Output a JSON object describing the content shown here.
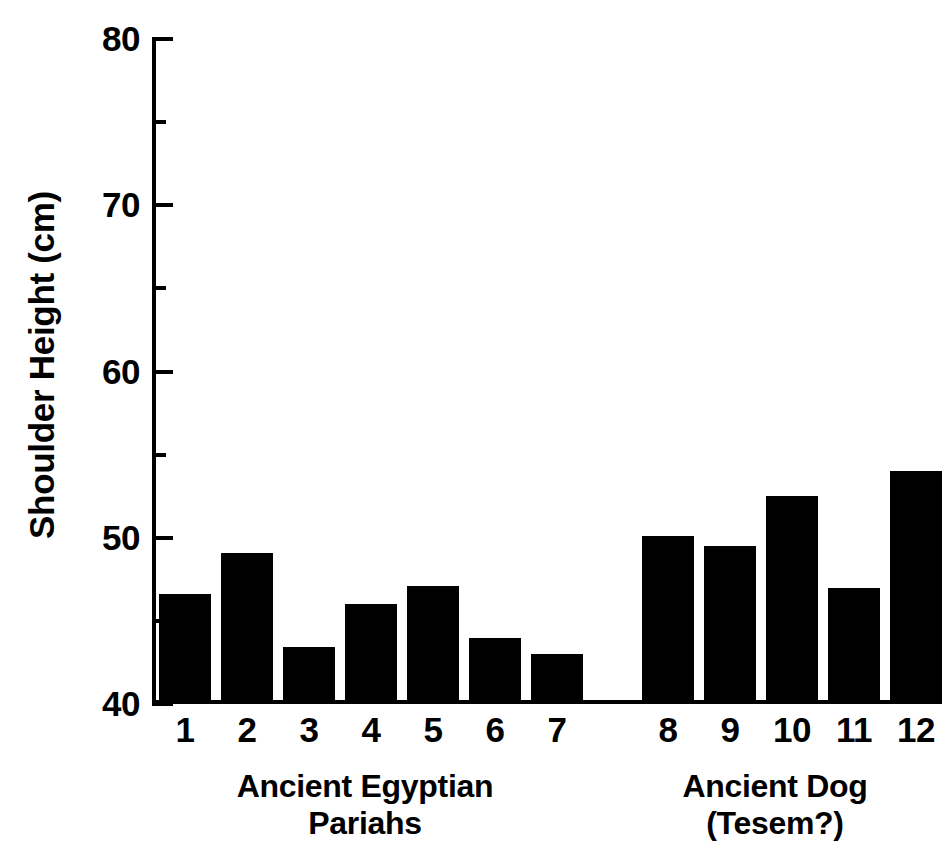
{
  "chart_data": {
    "type": "bar",
    "title": "",
    "xlabel": "",
    "ylabel": "Shoulder Height (cm)",
    "ylim": [
      40,
      80
    ],
    "ytick_major": [
      40,
      50,
      60,
      70,
      80
    ],
    "ytick_minor": [
      45,
      55,
      65,
      75
    ],
    "ytick_labels": [
      "80",
      "70",
      "60",
      "50",
      "40"
    ],
    "grid": false,
    "legend": null,
    "categories": [
      "1",
      "2",
      "3",
      "4",
      "5",
      "6",
      "7",
      "8",
      "9",
      "10",
      "11",
      "12"
    ],
    "values": [
      46.6,
      49.1,
      43.4,
      46.0,
      47.1,
      44.0,
      43.0,
      50.1,
      49.5,
      52.5,
      47.0,
      54.0
    ],
    "bar_color": "#000000",
    "groups": [
      {
        "label_lines": [
          "Ancient Egyptian",
          "Pariahs"
        ],
        "categories": [
          "1",
          "2",
          "3",
          "4",
          "5",
          "6",
          "7"
        ]
      },
      {
        "label_lines": [
          "Ancient Dog",
          "(Tesem?)"
        ],
        "categories": [
          "8",
          "9",
          "10",
          "11",
          "12"
        ]
      }
    ]
  },
  "axis": {
    "y_title": "Shoulder Height (cm)",
    "y_labels": [
      "80",
      "70",
      "60",
      "50",
      "40"
    ],
    "x_labels": [
      "1",
      "2",
      "3",
      "4",
      "5",
      "6",
      "7",
      "8",
      "9",
      "10",
      "11",
      "12"
    ]
  },
  "captions": {
    "group_0_line_1": "Ancient Egyptian",
    "group_0_line_2": "Pariahs",
    "group_1_line_1": "Ancient Dog",
    "group_1_line_2": "(Tesem?)"
  }
}
